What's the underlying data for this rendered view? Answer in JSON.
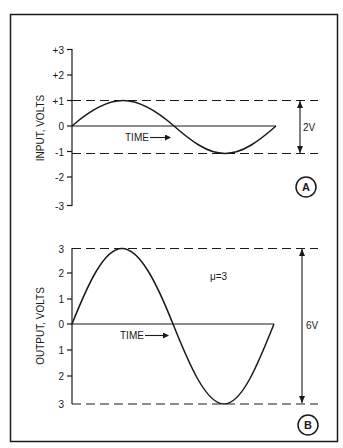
{
  "figure": {
    "stroke_color": "#1a1a1a",
    "background": "#ffffff"
  },
  "panel_a": {
    "label": "A",
    "y_axis_title": "INPUT, VOLTS",
    "y_ticks": [
      "+3",
      "+2",
      "+1",
      "0",
      "-1",
      "-2",
      "-3"
    ],
    "time_label": "TIME",
    "amplitude_label": "2V",
    "peak_volts": 1
  },
  "panel_b": {
    "label": "B",
    "y_axis_title": "OUTPUT, VOLTS",
    "y_ticks": [
      "3",
      "2",
      "1",
      "0",
      "1",
      "2",
      "3"
    ],
    "time_label": "TIME",
    "amplitude_label": "6V",
    "gain_label": "μ=3",
    "peak_volts": 3
  }
}
